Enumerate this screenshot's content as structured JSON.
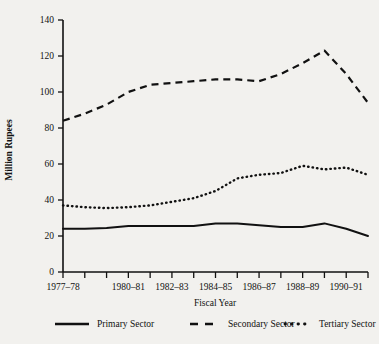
{
  "chart_data": {
    "type": "line",
    "title": "",
    "xlabel": "Fiscal Year",
    "ylabel": "Million Rupees",
    "ylim": [
      0,
      140
    ],
    "ytick_values": [
      0,
      20,
      40,
      60,
      80,
      100,
      120,
      140
    ],
    "ytick_labels": [
      "0",
      "20",
      "40",
      "60",
      "80",
      "100",
      "120",
      "140"
    ],
    "grid": false,
    "legend_position": "bottom",
    "categories": [
      "1977-78",
      "1978-79",
      "1979-80",
      "1980-81",
      "1981-82",
      "1982-83",
      "1983-84",
      "1984-85",
      "1985-86",
      "1986-87",
      "1987-88",
      "1988-89",
      "1989-90",
      "1990-91",
      "1991-92"
    ],
    "xtick_labels_shown": [
      "1977–78",
      "1980–81",
      "1982–83",
      "1984–85",
      "1986–87",
      "1988–89",
      "1990–91"
    ],
    "xtick_label_indices": [
      0,
      3,
      5,
      7,
      9,
      11,
      13
    ],
    "series": [
      {
        "name": "Primary Sector",
        "style": "solid",
        "color": "#111111",
        "values": [
          24,
          24,
          24.5,
          25.5,
          25.5,
          25.5,
          25.5,
          27,
          27,
          26,
          25,
          25,
          27,
          24,
          20
        ]
      },
      {
        "name": "Secondary Sector",
        "style": "dashed",
        "color": "#111111",
        "values": [
          84,
          88,
          93,
          100,
          104,
          105,
          106,
          107,
          107,
          106,
          110,
          116,
          123,
          110,
          94
        ]
      },
      {
        "name": "Tertiary Sector",
        "style": "dotted",
        "color": "#111111",
        "values": [
          37,
          36,
          35.5,
          36,
          37,
          39,
          41,
          45,
          52,
          54,
          55,
          59,
          57,
          58,
          54
        ]
      }
    ]
  },
  "legend": {
    "items": [
      {
        "label": "Primary Sector",
        "style": "solid"
      },
      {
        "label": "Secondary Sector",
        "style": "dashed"
      },
      {
        "label": "Tertiary Sector",
        "style": "dotted"
      }
    ]
  }
}
